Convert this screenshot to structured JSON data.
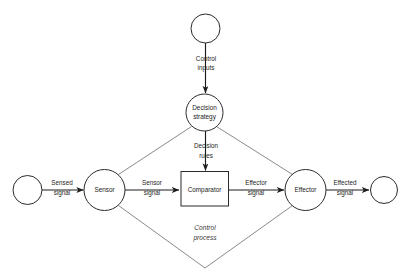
{
  "diagram": {
    "title": "Control process",
    "process_label": "Control process",
    "nodes": [
      {
        "id": "source",
        "label": "",
        "shape": "circle"
      },
      {
        "id": "control-input-source",
        "label": "",
        "shape": "circle"
      },
      {
        "id": "decision-strategy",
        "label": "Decision strategy",
        "label_line1": "Decision",
        "label_line2": "strategy",
        "shape": "circle"
      },
      {
        "id": "sensor",
        "label": "Sensor",
        "shape": "circle"
      },
      {
        "id": "comparator",
        "label": "Comparator",
        "shape": "rectangle"
      },
      {
        "id": "effector",
        "label": "Effector",
        "shape": "circle"
      },
      {
        "id": "sink",
        "label": "",
        "shape": "circle"
      }
    ],
    "edges": [
      {
        "id": "control-inputs",
        "label": "Control inputs",
        "label_line1": "Control",
        "label_line2": "inputs",
        "from": "control-input-source",
        "to": "decision-strategy",
        "arrow": true
      },
      {
        "id": "decision-rules",
        "label": "Decision rules",
        "label_line1": "Decision",
        "label_line2": "rules",
        "from": "decision-strategy",
        "to": "comparator",
        "arrow": true
      },
      {
        "id": "sensed-signal",
        "label": "Sensed signal",
        "label_line1": "Sensed",
        "label_line2": "signal",
        "from": "source",
        "to": "sensor",
        "arrow": true
      },
      {
        "id": "sensor-signal",
        "label": "Sensor signal",
        "label_line1": "Sensor",
        "label_line2": "signal",
        "from": "sensor",
        "to": "comparator",
        "arrow": true
      },
      {
        "id": "effector-signal",
        "label": "Effector signal",
        "label_line1": "Effector",
        "label_line2": "signal",
        "from": "comparator",
        "to": "effector",
        "arrow": true
      },
      {
        "id": "effected-signal",
        "label": "Effected signal",
        "label_line1": "Effected",
        "label_line2": "signal",
        "from": "effector",
        "to": "sink",
        "arrow": true
      },
      {
        "id": "strategy-sensor-link",
        "label": "",
        "from": "decision-strategy",
        "to": "sensor",
        "arrow": false
      },
      {
        "id": "strategy-effector-link",
        "label": "",
        "from": "decision-strategy",
        "to": "effector",
        "arrow": false
      },
      {
        "id": "sensor-bottom-link",
        "label": "",
        "from": "sensor",
        "to": "bottom-vertex",
        "arrow": false
      },
      {
        "id": "effector-bottom-link",
        "label": "",
        "from": "effector",
        "to": "bottom-vertex",
        "arrow": false
      }
    ],
    "colors": {
      "background": "#ffffff",
      "node_stroke": "#2b2b2b",
      "flow_stroke": "#1c1c1c",
      "thin_stroke": "#7d7d7d",
      "text": "#1c1c1c",
      "process_text": "#3a3a3a"
    }
  }
}
